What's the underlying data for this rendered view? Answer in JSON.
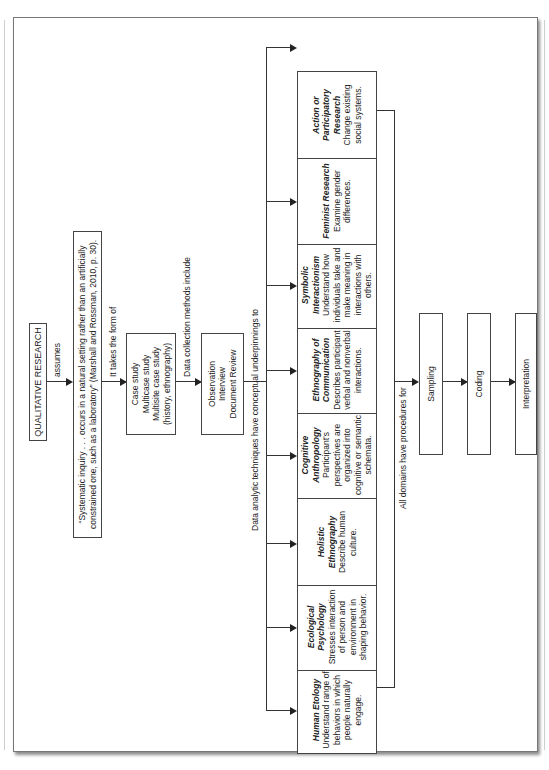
{
  "diagram": {
    "root": {
      "label": "QUALITATIVE RESEARCH"
    },
    "edges": {
      "assumes": "assumes",
      "takes_form": "It takes the form of",
      "data_collection": "Data collection methods include",
      "data_analytic": "Data analytic techniques have conceptual underpinnings to",
      "all_domains": "All domains have procedures for"
    },
    "quote": {
      "line1": "“Systematic inquiry . . . occurs in a natural setting rather than an artificially",
      "line2": "constrained one, such as a laboratory” (Marshall and Rossman, 2010, p. 30)."
    },
    "forms": [
      "Case study",
      "Multicase study",
      "Multisite case study",
      "(history, ethnography)"
    ],
    "methods": [
      "Observation",
      "Interview",
      "Document Review"
    ],
    "domains": [
      {
        "title": "Human Etology",
        "desc": "Understand range of behaviors in which people naturally engage."
      },
      {
        "title": "Ecological Psychology",
        "desc": "Stresses interaction of person and environment in shaping behavior."
      },
      {
        "title": "Holistic Ethnography",
        "desc": "Describe human culture."
      },
      {
        "title": "Cognitive Anthropology",
        "desc": "Participant’s perspectives are organized into cognitive or semantic schemata."
      },
      {
        "title": "Ethnography of Communication",
        "desc": "Describes participant verbal and nonverbal interactions."
      },
      {
        "title": "Symbolic Interactionism",
        "desc": "Understand how individuals take and make meaning in interactions with others."
      },
      {
        "title": "Feminist Research",
        "desc": "Examine gender differences."
      },
      {
        "title": "Action or Participatory Research",
        "desc": "Change existing social systems."
      }
    ],
    "procedures": [
      "Sampling",
      "Coding",
      "Interpretation"
    ]
  }
}
